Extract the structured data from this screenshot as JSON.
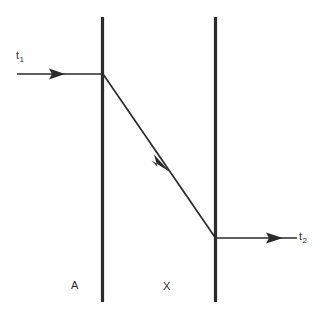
{
  "figure": {
    "background_color": "#ffffff",
    "stroke_color": "#2b2b2b",
    "width": 328,
    "height": 321
  },
  "labels": {
    "incoming_ray": {
      "base": "t",
      "sub": "1",
      "text": "t1"
    },
    "outgoing_ray": {
      "base": "t",
      "sub": "2",
      "text": "t2"
    },
    "region_left": "A",
    "region_middle": "X"
  },
  "elements": {
    "boundary_left": {
      "name": "vertical-boundary-left",
      "x": 102.5,
      "y_top": 17,
      "y_bottom": 302,
      "width": 3.2
    },
    "boundary_right": {
      "name": "vertical-boundary-right",
      "x": 215.5,
      "y_top": 17,
      "y_bottom": 302,
      "width": 3.2
    },
    "incoming_ray": {
      "name": "incoming-ray-arrow",
      "x_start": 17,
      "x_end": 103,
      "y": 74,
      "arrow_tip_x": 65,
      "width": 1.6
    },
    "diagonal_ray": {
      "name": "diagonal-ray-arrow",
      "x_start": 103,
      "y_start": 74,
      "x_end": 215,
      "y_end": 238,
      "arrow_tip_x": 170,
      "arrow_tip_y": 172,
      "width": 1.6
    },
    "outgoing_ray": {
      "name": "outgoing-ray-arrow",
      "x_start": 215,
      "x_end": 297,
      "y": 238,
      "arrow_tip_x": 283,
      "width": 1.6
    }
  }
}
